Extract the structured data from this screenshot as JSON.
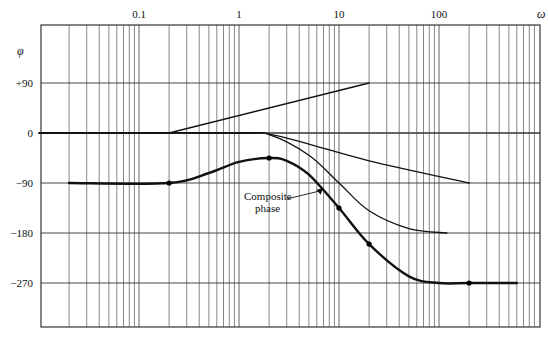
{
  "chart_data": {
    "type": "line",
    "title": "",
    "xlabel": "ω",
    "ylabel": "φ",
    "xscale": "log",
    "xlim": [
      0.01,
      1000
    ],
    "ylim": [
      -330,
      190
    ],
    "grid": true,
    "x_tick_labels": [
      {
        "value": 0.1,
        "label": "0.1"
      },
      {
        "value": 1,
        "label": "1"
      },
      {
        "value": 10,
        "label": "10"
      },
      {
        "value": 100,
        "label": "100"
      }
    ],
    "y_tick_labels": [
      {
        "value": 90,
        "label": "+90"
      },
      {
        "value": 0,
        "label": "0"
      },
      {
        "value": -90,
        "label": "−90"
      },
      {
        "value": -180,
        "label": "−180"
      },
      {
        "value": -270,
        "label": "−270"
      }
    ],
    "series": [
      {
        "name": "zero term (+45°/decade)",
        "style": "thin",
        "points": [
          [
            0.01,
            0
          ],
          [
            0.2,
            0
          ],
          [
            20,
            90
          ]
        ]
      },
      {
        "name": "first-order pole term",
        "style": "thin",
        "points": [
          [
            0.01,
            0
          ],
          [
            1,
            0
          ],
          [
            2,
            -2
          ],
          [
            5,
            -20
          ],
          [
            20,
            -50
          ],
          [
            200,
            -90
          ]
        ]
      },
      {
        "name": "second-order pole term",
        "style": "thin",
        "points": [
          [
            0.01,
            0
          ],
          [
            1,
            0
          ],
          [
            2,
            -3
          ],
          [
            5,
            -40
          ],
          [
            10,
            -90
          ],
          [
            20,
            -140
          ],
          [
            50,
            -172
          ],
          [
            120,
            -180
          ]
        ]
      },
      {
        "name": "Composite phase",
        "style": "thick",
        "points": [
          [
            0.02,
            -90
          ],
          [
            0.2,
            -90
          ],
          [
            0.5,
            -72
          ],
          [
            1,
            -52
          ],
          [
            2,
            -45
          ],
          [
            3,
            -50
          ],
          [
            5,
            -75
          ],
          [
            10,
            -135
          ],
          [
            20,
            -200
          ],
          [
            50,
            -258
          ],
          [
            100,
            -270
          ],
          [
            200,
            -270
          ],
          [
            600,
            -270
          ]
        ],
        "markers": [
          [
            0.2,
            -90
          ],
          [
            2,
            -45
          ],
          [
            10,
            -135
          ],
          [
            20,
            -200
          ],
          [
            200,
            -270
          ]
        ]
      }
    ],
    "annotations": [
      {
        "text_lines": [
          "Composite",
          "phase"
        ],
        "arrow_to": [
          7,
          -95
        ]
      }
    ]
  }
}
